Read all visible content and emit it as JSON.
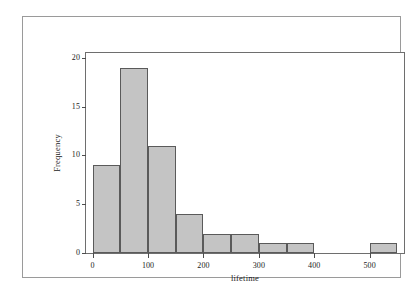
{
  "chart_data": {
    "type": "bar",
    "title": "",
    "subtitle": "",
    "xlabel": "lifetime",
    "ylabel": "Frequency",
    "xlim": [
      -12,
      562
    ],
    "ylim": [
      0,
      20.5
    ],
    "grid": false,
    "legend": null,
    "bin_width": 50,
    "bin_edges": [
      0,
      50,
      100,
      150,
      200,
      250,
      300,
      350,
      400,
      450,
      500,
      550
    ],
    "categories": [
      "0-50",
      "50-100",
      "100-150",
      "150-200",
      "200-250",
      "250-300",
      "300-350",
      "350-400",
      "400-450",
      "450-500",
      "500-550"
    ],
    "values": [
      9,
      19,
      11,
      4,
      2,
      2,
      1,
      1,
      0,
      0,
      1
    ],
    "bars": [
      {
        "x0": 0,
        "x1": 50,
        "height": 9
      },
      {
        "x0": 50,
        "x1": 100,
        "height": 19
      },
      {
        "x0": 100,
        "x1": 150,
        "height": 11
      },
      {
        "x0": 150,
        "x1": 200,
        "height": 4
      },
      {
        "x0": 200,
        "x1": 250,
        "height": 2
      },
      {
        "x0": 250,
        "x1": 300,
        "height": 2
      },
      {
        "x0": 300,
        "x1": 350,
        "height": 1
      },
      {
        "x0": 350,
        "x1": 400,
        "height": 1
      },
      {
        "x0": 400,
        "x1": 450,
        "height": 0
      },
      {
        "x0": 450,
        "x1": 500,
        "height": 0
      },
      {
        "x0": 500,
        "x1": 550,
        "height": 1
      }
    ],
    "xticks": [
      0,
      100,
      200,
      300,
      400,
      500
    ],
    "xtick_labels": [
      "0",
      "100",
      "200",
      "300",
      "400",
      "500"
    ],
    "yticks": [
      0,
      5,
      10,
      15,
      20
    ],
    "ytick_labels": [
      "0",
      "5",
      "10",
      "15",
      "20"
    ],
    "colors": {
      "bar_fill": "#c4c4c4",
      "bar_edge": "#5a5a5a",
      "axis": "#6e6e6e",
      "tick": "#4d4d4d",
      "text": "#1a1a1a",
      "plot_background": "#ffffff",
      "figure_border": "#9a9a9a"
    }
  }
}
